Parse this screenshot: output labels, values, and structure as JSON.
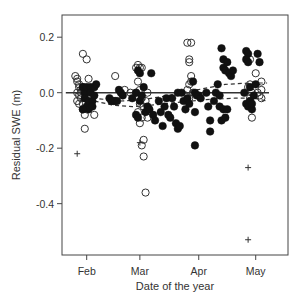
{
  "chart_data": {
    "type": "scatter",
    "title": "",
    "xlabel": "Date of the year",
    "ylabel": "Residual SWE (m)",
    "xlim": [
      19,
      138
    ],
    "ylim": [
      -0.585,
      0.28
    ],
    "x_ticks": [
      {
        "label": "Feb",
        "value": 32
      },
      {
        "label": "Mar",
        "value": 60
      },
      {
        "label": "Apr",
        "value": 91
      },
      {
        "label": "May",
        "value": 121
      }
    ],
    "y_ticks": [
      {
        "label": "0.2",
        "value": 0.2
      },
      {
        "label": "0.0",
        "value": 0.0
      },
      {
        "label": "-0.2",
        "value": -0.2
      },
      {
        "label": "-0.4",
        "value": -0.4
      }
    ],
    "grid": false,
    "legend": null,
    "series": [
      {
        "name": "open-circles",
        "marker": "open-circle",
        "points": [
          [
            26,
            0.06
          ],
          [
            27,
            0.05
          ],
          [
            27,
            0.04
          ],
          [
            28,
            0.03
          ],
          [
            28,
            0.02
          ],
          [
            27,
            0.0
          ],
          [
            28,
            -0.01
          ],
          [
            27,
            -0.03
          ],
          [
            28,
            -0.04
          ],
          [
            29,
            0.01
          ],
          [
            30,
            0.14
          ],
          [
            32,
            0.12
          ],
          [
            33,
            0.05
          ],
          [
            31,
            -0.02
          ],
          [
            32,
            -0.06
          ],
          [
            31,
            -0.08
          ],
          [
            31,
            -0.13
          ],
          [
            29,
            -0.02
          ],
          [
            30,
            -0.04
          ],
          [
            36,
            -0.08
          ],
          [
            29,
            0.0
          ],
          [
            30,
            0.02
          ],
          [
            31,
            0.0
          ],
          [
            32,
            0.01
          ],
          [
            30,
            -0.06
          ],
          [
            47,
            0.06
          ],
          [
            52,
            0.01
          ],
          [
            55,
            0.0
          ],
          [
            58,
            0.09
          ],
          [
            59,
            0.1
          ],
          [
            60,
            0.09
          ],
          [
            61,
            0.09
          ],
          [
            59,
            0.04
          ],
          [
            60,
            0.01
          ],
          [
            58,
            0.0
          ],
          [
            61,
            -0.02
          ],
          [
            60,
            -0.04
          ],
          [
            59,
            -0.07
          ],
          [
            61,
            -0.09
          ],
          [
            60,
            -0.11
          ],
          [
            61,
            -0.19
          ],
          [
            62,
            -0.17
          ],
          [
            62,
            -0.23
          ],
          [
            63,
            -0.36
          ],
          [
            62,
            -0.05
          ],
          [
            63,
            -0.03
          ],
          [
            64,
            0.0
          ],
          [
            64,
            -0.09
          ],
          [
            85,
            0.18
          ],
          [
            87,
            0.18
          ],
          [
            86,
            0.12
          ],
          [
            86,
            0.11
          ],
          [
            87,
            0.06
          ],
          [
            87,
            0.04
          ],
          [
            86,
            0.03
          ],
          [
            85,
            0.01
          ],
          [
            88,
            0.0
          ],
          [
            86,
            -0.02
          ],
          [
            118,
            0.12
          ],
          [
            117,
            0.02
          ],
          [
            118,
            0.03
          ],
          [
            119,
            0.0
          ],
          [
            118,
            -0.02
          ],
          [
            119,
            -0.09
          ],
          [
            121,
            0.07
          ],
          [
            124,
            0.04
          ],
          [
            124,
            0.01
          ],
          [
            123,
            -0.01
          ],
          [
            124,
            -0.02
          ],
          [
            122,
            0.0
          ]
        ]
      },
      {
        "name": "filled-circles",
        "marker": "filled-circle",
        "points": [
          [
            30,
            0.02
          ],
          [
            31,
            0.0
          ],
          [
            31,
            -0.02
          ],
          [
            32,
            -0.05
          ],
          [
            33,
            -0.06
          ],
          [
            32,
            0.02
          ],
          [
            34,
            0.02
          ],
          [
            33,
            -0.03
          ],
          [
            30,
            -0.06
          ],
          [
            34,
            0.0
          ],
          [
            36,
            0.02
          ],
          [
            37,
            0.03
          ],
          [
            35,
            -0.03
          ],
          [
            35,
            -0.05
          ],
          [
            36,
            -0.01
          ],
          [
            44,
            -0.02
          ],
          [
            45,
            -0.03
          ],
          [
            46,
            -0.03
          ],
          [
            47,
            -0.03
          ],
          [
            48,
            -0.03
          ],
          [
            49,
            0.01
          ],
          [
            50,
            0.0
          ],
          [
            51,
            -0.01
          ],
          [
            56,
            -0.02
          ],
          [
            58,
            0.0
          ],
          [
            59,
            0.08
          ],
          [
            60,
            0.07
          ],
          [
            58,
            -0.08
          ],
          [
            59,
            -0.09
          ],
          [
            60,
            -0.03
          ],
          [
            61,
            -0.01
          ],
          [
            62,
            0.02
          ],
          [
            63,
            -0.07
          ],
          [
            64,
            -0.05
          ],
          [
            66,
            0.07
          ],
          [
            65,
            -0.06
          ],
          [
            67,
            -0.08
          ],
          [
            68,
            -0.1
          ],
          [
            70,
            -0.03
          ],
          [
            71,
            -0.07
          ],
          [
            72,
            -0.12
          ],
          [
            73,
            -0.05
          ],
          [
            74,
            -0.02
          ],
          [
            75,
            -0.08
          ],
          [
            76,
            -0.09
          ],
          [
            77,
            -0.02
          ],
          [
            78,
            -0.05
          ],
          [
            79,
            -0.11
          ],
          [
            80,
            -0.13
          ],
          [
            81,
            -0.12
          ],
          [
            80,
            0.0
          ],
          [
            82,
            0.0
          ],
          [
            83,
            -0.03
          ],
          [
            84,
            -0.06
          ],
          [
            85,
            -0.02
          ],
          [
            86,
            -0.04
          ],
          [
            88,
            0.04
          ],
          [
            89,
            0.0
          ],
          [
            89,
            -0.07
          ],
          [
            89,
            -0.19
          ],
          [
            90,
            -0.01
          ],
          [
            91,
            -0.01
          ],
          [
            92,
            -0.02
          ],
          [
            95,
            0.0
          ],
          [
            96,
            -0.05
          ],
          [
            97,
            -0.1
          ],
          [
            97,
            -0.14
          ],
          [
            99,
            -0.03
          ],
          [
            100,
            0.0
          ],
          [
            101,
            0.03
          ],
          [
            102,
            -0.01
          ],
          [
            102,
            -0.05
          ],
          [
            103,
            -0.1
          ],
          [
            104,
            -0.06
          ],
          [
            105,
            -0.09
          ],
          [
            106,
            -0.06
          ],
          [
            103,
            0.16
          ],
          [
            104,
            0.12
          ],
          [
            104,
            0.09
          ],
          [
            105,
            0.08
          ],
          [
            106,
            0.11
          ],
          [
            107,
            0.07
          ],
          [
            108,
            0.06
          ],
          [
            109,
            0.08
          ],
          [
            116,
            0.15
          ],
          [
            117,
            0.14
          ],
          [
            116,
            0.12
          ],
          [
            117,
            0.11
          ],
          [
            118,
            0.02
          ],
          [
            115,
            0.0
          ],
          [
            116,
            -0.04
          ],
          [
            117,
            -0.05
          ],
          [
            118,
            -0.03
          ],
          [
            119,
            -0.06
          ],
          [
            119,
            -0.04
          ],
          [
            122,
            0.14
          ],
          [
            123,
            0.11
          ],
          [
            121,
            0.03
          ],
          [
            120,
            -0.01
          ]
        ]
      },
      {
        "name": "plus-markers",
        "marker": "plus",
        "points": [
          [
            27,
            -0.22
          ],
          [
            60,
            -0.18
          ],
          [
            117,
            -0.27
          ],
          [
            117,
            -0.53
          ]
        ]
      }
    ],
    "lines": [
      {
        "name": "zero-line",
        "style": "solid",
        "points": [
          [
            21,
            0.0
          ],
          [
            128,
            0.0
          ]
        ]
      },
      {
        "name": "lower-dashed-fit",
        "style": "dashed",
        "points": [
          [
            26,
            -0.0
          ],
          [
            36,
            -0.03
          ],
          [
            46,
            -0.045
          ],
          [
            56,
            -0.05
          ],
          [
            66,
            -0.045
          ],
          [
            80,
            -0.035
          ],
          [
            95,
            -0.025
          ],
          [
            110,
            -0.02
          ],
          [
            120,
            -0.02
          ],
          [
            127,
            -0.03
          ]
        ]
      },
      {
        "name": "upper-dashed-fit",
        "style": "dashed",
        "points": [
          [
            35,
            -0.02
          ],
          [
            50,
            -0.03
          ],
          [
            62,
            -0.025
          ],
          [
            75,
            -0.01
          ],
          [
            90,
            0.01
          ],
          [
            105,
            0.03
          ],
          [
            118,
            0.035
          ],
          [
            127,
            0.035
          ]
        ]
      }
    ]
  },
  "axes": {
    "xlabel": "Date of the year",
    "ylabel": "Residual SWE (m)"
  }
}
